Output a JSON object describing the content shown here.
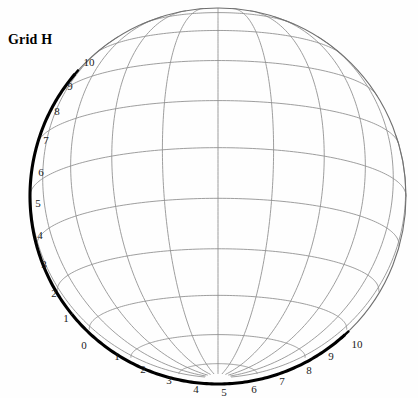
{
  "figure": {
    "title": "Grid H",
    "type": "sphere-graticule-nomogram",
    "background_color": "#ffffff",
    "grid_color": "#8d8d8d",
    "scale_color": "#000000"
  },
  "sphere": {
    "center_x": 218,
    "center_y": 196,
    "radius": 188,
    "outline_color": "#6f6f6f"
  },
  "scales": [
    {
      "name": "left-limb-scale",
      "orientation": "vertical-left",
      "direction": "bottom-to-top",
      "end_tick": true,
      "labels": [
        {
          "value": "0",
          "x": 84,
          "y": 345
        },
        {
          "value": "1",
          "x": 66,
          "y": 318
        },
        {
          "value": "2",
          "x": 54,
          "y": 293
        },
        {
          "value": "3",
          "x": 44,
          "y": 264
        },
        {
          "value": "4",
          "x": 40,
          "y": 235
        },
        {
          "value": "5",
          "x": 38,
          "y": 203
        },
        {
          "value": "6",
          "x": 41,
          "y": 172
        },
        {
          "value": "7",
          "x": 46,
          "y": 140
        },
        {
          "value": "8",
          "x": 57,
          "y": 111
        },
        {
          "value": "9",
          "x": 70,
          "y": 86
        },
        {
          "value": "10",
          "x": 89,
          "y": 62
        }
      ]
    },
    {
      "name": "bottom-limb-scale",
      "orientation": "horizontal-bottom",
      "direction": "left-to-right",
      "end_tick": true,
      "labels": [
        {
          "value": "1",
          "x": 117,
          "y": 356
        },
        {
          "value": "2",
          "x": 143,
          "y": 369
        },
        {
          "value": "3",
          "x": 169,
          "y": 380
        },
        {
          "value": "4",
          "x": 196,
          "y": 389
        },
        {
          "value": "5",
          "x": 224,
          "y": 392
        },
        {
          "value": "6",
          "x": 254,
          "y": 389
        },
        {
          "value": "7",
          "x": 282,
          "y": 381
        },
        {
          "value": "8",
          "x": 309,
          "y": 370
        },
        {
          "value": "9",
          "x": 331,
          "y": 356
        },
        {
          "value": "10",
          "x": 357,
          "y": 344
        }
      ]
    }
  ],
  "graticule": {
    "meridian_count": 11,
    "parallel_count": 11,
    "description": "Orthographic-style sphere grid of meridians and parallels"
  }
}
